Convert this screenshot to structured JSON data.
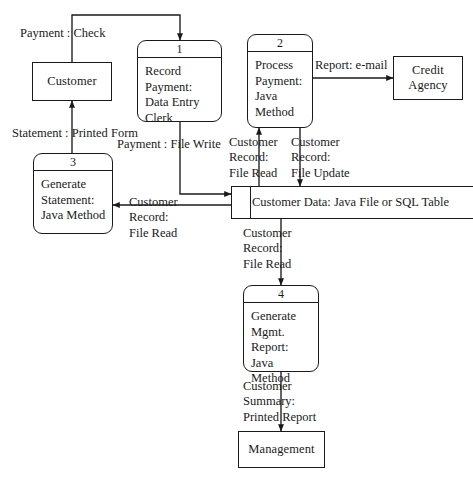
{
  "diagram": {
    "type": "data-flow-diagram",
    "external_entities": [
      {
        "id": "customer",
        "label": "Customer"
      },
      {
        "id": "credit",
        "label": "Credit\nAgency"
      },
      {
        "id": "management",
        "label": "Management"
      }
    ],
    "processes": [
      {
        "id": "p1",
        "number": "1",
        "label": "Record\nPayment:\nData Entry\nClerk"
      },
      {
        "id": "p2",
        "number": "2",
        "label": "Process\nPayment:\nJava Method"
      },
      {
        "id": "p3",
        "number": "3",
        "label": "Generate\nStatement:\nJava Method"
      },
      {
        "id": "p4",
        "number": "4",
        "label": "Generate\nMgmt.\nReport:\nJava Method"
      }
    ],
    "data_stores": [
      {
        "id": "ds1",
        "label": "Customer Data: Java File or SQL Table"
      }
    ],
    "flows": [
      {
        "id": "f1",
        "label": "Payment : Check",
        "from": "customer",
        "to": "p1"
      },
      {
        "id": "f2",
        "label": "Statement : Printed Form",
        "from": "p3",
        "to": "customer"
      },
      {
        "id": "f3",
        "label": "Payment : File Write",
        "from": "p1",
        "to": "ds1"
      },
      {
        "id": "f4",
        "label": "Report: e-mail",
        "from": "p2",
        "to": "credit"
      },
      {
        "id": "f5",
        "label": "Customer\nRecord:\nFile Read",
        "from": "ds1",
        "to": "p2"
      },
      {
        "id": "f6",
        "label": "Customer\nRecord:\nFile Update",
        "from": "p2",
        "to": "ds1"
      },
      {
        "id": "f7",
        "label": "Customer\nRecord:\nFile Read",
        "from": "ds1",
        "to": "p3"
      },
      {
        "id": "f8",
        "label": "Customer\nRecord:\nFile Read",
        "from": "ds1",
        "to": "p4"
      },
      {
        "id": "f9",
        "label": "Customer\nSummary:\nPrinted Report",
        "from": "p4",
        "to": "management"
      }
    ],
    "colors": {
      "stroke": "#1a1a1a",
      "background": "#ffffff"
    }
  }
}
